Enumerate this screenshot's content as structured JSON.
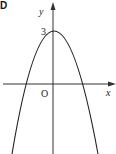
{
  "option_label": "D",
  "axes": {
    "x_label": "x",
    "y_label": "y",
    "origin_label": "O",
    "y_intercept_label": "3"
  },
  "curve": {
    "type": "parabola",
    "opens": "down",
    "vertex": [
      0,
      3
    ],
    "color": "#222222"
  }
}
